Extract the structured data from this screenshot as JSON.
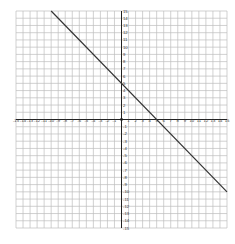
{
  "chart_data": {
    "type": "line",
    "title": "",
    "xlabel": "",
    "ylabel": "",
    "xlim": [
      -15,
      15
    ],
    "ylim": [
      -15,
      15
    ],
    "grid": true,
    "x_ticks": [
      -15,
      -14,
      -13,
      -12,
      -11,
      -10,
      -9,
      -8,
      -7,
      -6,
      -5,
      -4,
      -3,
      -2,
      -1,
      1,
      2,
      3,
      4,
      5,
      6,
      7,
      8,
      9,
      10,
      11,
      12,
      13,
      14,
      15
    ],
    "y_ticks": [
      -15,
      -14,
      -13,
      -12,
      -11,
      -10,
      -9,
      -8,
      -7,
      -6,
      -5,
      -4,
      -3,
      -2,
      -1,
      1,
      2,
      3,
      4,
      5,
      6,
      7,
      8,
      9,
      10,
      11,
      12,
      13,
      14,
      15
    ],
    "series": [
      {
        "name": "y = -x + 5",
        "slope": -1,
        "intercept": 5,
        "x": [
          -10,
          15
        ],
        "y": [
          15,
          -10
        ],
        "color": "#333333"
      }
    ],
    "origin_point": [
      0,
      0
    ]
  },
  "colors": {
    "grid": "#bdbdbd",
    "axis": "#222222",
    "line": "#333333"
  }
}
